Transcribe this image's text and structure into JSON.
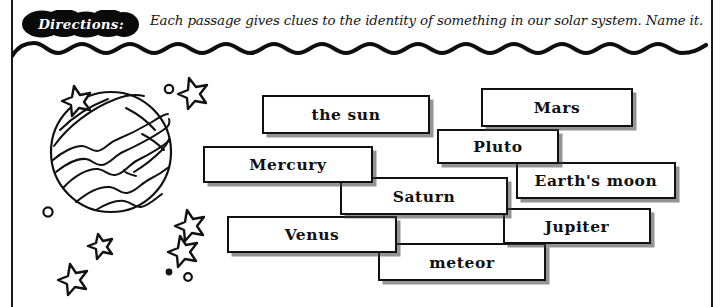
{
  "worksheet": {
    "directions": {
      "badge_label": "Directions:",
      "badge_icon": "cloud-bubble-badge",
      "instruction_text": "Each passage gives clues to the identity of something in our solar system. Name it."
    },
    "divider": {
      "icon": "wavy-line-divider"
    },
    "illustration": {
      "planet_icon": "striped-planet-icon",
      "star_icon": "star-icon",
      "dot_icon": "small-circle-icon",
      "star_count": 6,
      "dot_count": 5
    },
    "word_bank": {
      "items": [
        {
          "label": "the sun",
          "name": "word-box-the-sun"
        },
        {
          "label": "Mars",
          "name": "word-box-mars"
        },
        {
          "label": "Pluto",
          "name": "word-box-pluto"
        },
        {
          "label": "Mercury",
          "name": "word-box-mercury"
        },
        {
          "label": "Earth's moon",
          "name": "word-box-earths-moon"
        },
        {
          "label": "Saturn",
          "name": "word-box-saturn"
        },
        {
          "label": "Venus",
          "name": "word-box-venus"
        },
        {
          "label": "Jupiter",
          "name": "word-box-jupiter"
        },
        {
          "label": "meteor",
          "name": "word-box-meteor"
        }
      ]
    },
    "colors": {
      "ink": "#111111",
      "paper": "#ffffff",
      "shadow": "#3c3c3c"
    }
  }
}
